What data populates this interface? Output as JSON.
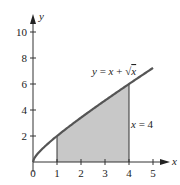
{
  "chart_data": {
    "type": "area",
    "title": "",
    "xlabel": "x",
    "ylabel": "y",
    "xlim": [
      0,
      5
    ],
    "ylim": [
      0,
      10
    ],
    "x_ticks": [
      0,
      1,
      2,
      3,
      4,
      5
    ],
    "x_tick_labels": [
      "0",
      "1",
      "2",
      "3",
      "4",
      "5"
    ],
    "y_ticks": [
      2,
      4,
      6,
      8,
      10
    ],
    "y_tick_labels": [
      "2",
      "4",
      "6",
      "8",
      "10"
    ],
    "grid": false,
    "series": [
      {
        "name": "y = x + √x",
        "kind": "curve",
        "x": [
          0,
          0.25,
          0.5,
          1,
          1.5,
          2,
          2.5,
          3,
          3.5,
          4,
          4.5,
          5
        ],
        "y": [
          0,
          0.75,
          1.21,
          2,
          2.72,
          3.41,
          4.08,
          4.73,
          5.37,
          6,
          6.62,
          7.24
        ]
      }
    ],
    "shaded_region": {
      "x_from": 1,
      "x_to": 4,
      "under": "y = x + √x",
      "color": "#c8c8c8"
    },
    "annotations": [
      {
        "text": "y = x + √x",
        "at": [
          2.5,
          7.2
        ]
      },
      {
        "text": "x = 4",
        "at": [
          4.1,
          3
        ]
      }
    ],
    "vertical_lines": [
      1,
      4
    ]
  },
  "labels": {
    "axis_x": "x",
    "axis_y": "y",
    "curve_label": {
      "y": "y",
      "eq": " = ",
      "x": "x",
      "plus": " + ",
      "sqrt": "√",
      "rad": "x"
    },
    "line_label": {
      "x": "x",
      "eq": " = 4"
    },
    "x_ticks": [
      "0",
      "1",
      "2",
      "3",
      "4",
      "5"
    ],
    "y_ticks": [
      "2",
      "4",
      "6",
      "8",
      "10"
    ]
  }
}
